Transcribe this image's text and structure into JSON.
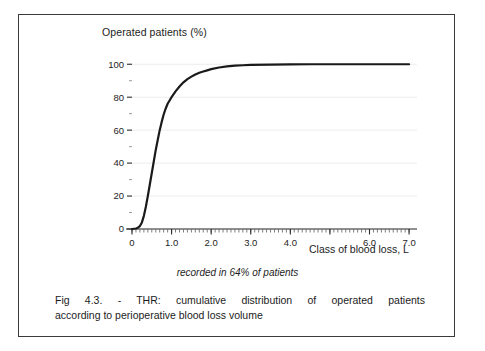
{
  "figure": {
    "caption_line_1": "Fig 4.3. - THR: cumulative distribution of operated patients",
    "caption_line_2": "according to perioperative blood loss volume",
    "note": "recorded in 64% of  patients",
    "border_color": "#3a3a3a"
  },
  "chart_data": {
    "type": "line",
    "title": "",
    "subtitle": "recorded in 64% of  patients",
    "ylabel": "Operated patients (%)",
    "xlabel": "Class of blood loss, L",
    "xlim": [
      0,
      7.2
    ],
    "ylim": [
      0,
      105
    ],
    "grid": true,
    "grid_color": "#ededed",
    "legend": "none",
    "line_color": "#1a1a1a",
    "line_width": 2.2,
    "x_ticks": [
      0,
      1.0,
      2.0,
      3.0,
      4.0,
      5.0,
      6.0,
      7.0
    ],
    "x_tick_labels": [
      "0",
      "1.0",
      "2.0",
      "3.0",
      "4.0",
      "",
      "6.0",
      "7.0"
    ],
    "x_minor_tick_step": 0.1,
    "y_ticks": [
      0,
      20,
      40,
      60,
      80,
      100
    ],
    "y_tick_labels": [
      "0",
      "20",
      "40",
      "60",
      "80",
      "100"
    ],
    "y_minor_ticks": [
      10,
      30,
      50,
      70,
      90
    ],
    "x": [
      0.0,
      0.1,
      0.15,
      0.2,
      0.25,
      0.3,
      0.35,
      0.4,
      0.45,
      0.5,
      0.55,
      0.6,
      0.65,
      0.7,
      0.75,
      0.8,
      0.85,
      0.9,
      0.95,
      1.0,
      1.1,
      1.2,
      1.3,
      1.4,
      1.5,
      1.6,
      1.7,
      1.8,
      1.9,
      2.0,
      2.2,
      2.4,
      2.6,
      2.8,
      3.0,
      3.5,
      4.0,
      4.5,
      5.0,
      5.5,
      6.0,
      6.5,
      7.0
    ],
    "y": [
      0.0,
      0.3,
      0.8,
      1.8,
      4.0,
      8.0,
      13.5,
      20.0,
      27.0,
      34.0,
      41.0,
      48.0,
      54.0,
      60.0,
      65.0,
      69.5,
      73.0,
      76.0,
      78.0,
      80.0,
      83.5,
      86.5,
      89.0,
      91.0,
      92.5,
      93.8,
      94.8,
      95.6,
      96.3,
      97.0,
      98.0,
      98.7,
      99.1,
      99.4,
      99.6,
      99.8,
      99.9,
      100.0,
      100.0,
      100.0,
      100.0,
      100.0,
      100.0
    ],
    "series_name": "Cumulative % of operated patients"
  }
}
